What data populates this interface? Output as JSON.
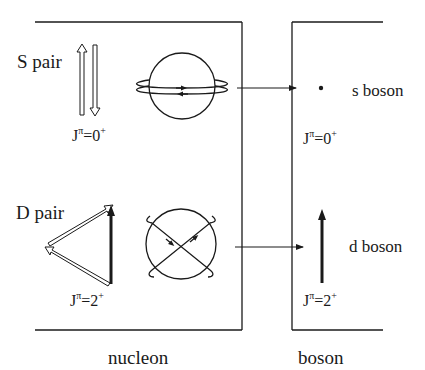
{
  "diagram": {
    "nucleon_panel": {
      "title": "nucleon",
      "s_pair": {
        "label": "S pair",
        "jp_base": "J",
        "jp_pi": "π",
        "jp_eq": "=0",
        "jp_sign": "+"
      },
      "d_pair": {
        "label": "D pair",
        "jp_base": "J",
        "jp_pi": "π",
        "jp_eq": "=2",
        "jp_sign": "+"
      }
    },
    "boson_panel": {
      "title": "boson",
      "s_boson": {
        "label": "s boson",
        "jp_base": "J",
        "jp_pi": "π",
        "jp_eq": "=0",
        "jp_sign": "+"
      },
      "d_boson": {
        "label": "d boson",
        "jp_base": "J",
        "jp_pi": "π",
        "jp_eq": "=2",
        "jp_sign": "+"
      }
    },
    "colors": {
      "ink": "#1a1a1a",
      "background": "#ffffff"
    }
  }
}
